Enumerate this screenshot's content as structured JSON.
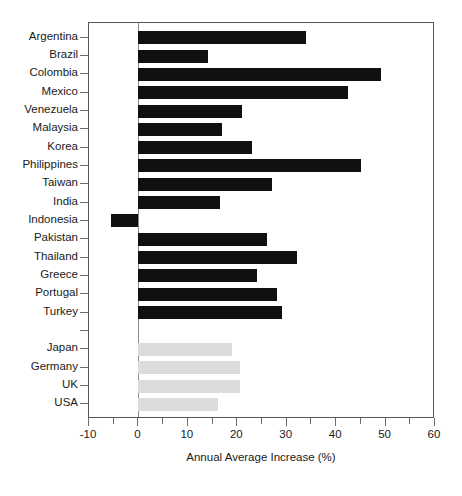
{
  "chart_data": {
    "type": "bar",
    "orientation": "horizontal",
    "title": "",
    "xlabel": "Annual Average Increase (%)",
    "ylabel": "",
    "xlim": [
      -10,
      60
    ],
    "xticks": [
      -10,
      0,
      10,
      20,
      30,
      40,
      50,
      60
    ],
    "xtick_labels": [
      "-10",
      "0",
      "10",
      "20",
      "30",
      "40",
      "50",
      "60"
    ],
    "xtick_minor_step": 5,
    "grid": false,
    "legend": "none",
    "zero_reference_line": true,
    "colors": {
      "developing": "#101010",
      "developed": "#dcdcdc",
      "axis": "#555555",
      "text": "#1a1a1a"
    },
    "groups": [
      {
        "name": "developing",
        "color": "#101010",
        "categories": [
          "Argentina",
          "Brazil",
          "Colombia",
          "Mexico",
          "Venezuela",
          "Malaysia",
          "Korea",
          "Philippines",
          "Taiwan",
          "India",
          "Indonesia",
          "Pakistan",
          "Thailand",
          "Greece",
          "Portugal",
          "Turkey"
        ],
        "values": [
          34,
          14,
          49,
          42.5,
          21,
          17,
          23,
          45,
          27,
          16.5,
          -5.5,
          26,
          32,
          24,
          28,
          29
        ]
      },
      {
        "name": "developed",
        "color": "#dcdcdc",
        "categories": [
          "Japan",
          "Germany",
          "UK",
          "USA"
        ],
        "values": [
          19,
          20.5,
          20.5,
          16
        ]
      }
    ],
    "categories": [
      "Argentina",
      "Brazil",
      "Colombia",
      "Mexico",
      "Venezuela",
      "Malaysia",
      "Korea",
      "Philippines",
      "Taiwan",
      "India",
      "Indonesia",
      "Pakistan",
      "Thailand",
      "Greece",
      "Portugal",
      "Turkey",
      "",
      "Japan",
      "Germany",
      "UK",
      "USA"
    ],
    "values": [
      34,
      14,
      49,
      42.5,
      21,
      17,
      23,
      45,
      27,
      16.5,
      -5.5,
      26,
      32,
      24,
      28,
      29,
      null,
      19,
      20.5,
      20.5,
      16
    ],
    "bar_colors": [
      "#101010",
      "#101010",
      "#101010",
      "#101010",
      "#101010",
      "#101010",
      "#101010",
      "#101010",
      "#101010",
      "#101010",
      "#101010",
      "#101010",
      "#101010",
      "#101010",
      "#101010",
      "#101010",
      null,
      "#dcdcdc",
      "#dcdcdc",
      "#dcdcdc",
      "#dcdcdc"
    ]
  }
}
